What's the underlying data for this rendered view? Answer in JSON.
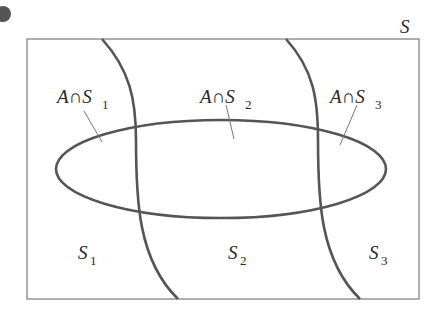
{
  "diagram": {
    "universe_label": "S",
    "set_label": "A",
    "intersection_symbol": "∩",
    "regions": [
      {
        "label": "A∩S1",
        "base": "S",
        "sub": "1",
        "prefix": "A∩"
      },
      {
        "label": "A∩S2",
        "base": "S",
        "sub": "2",
        "prefix": "A∩"
      },
      {
        "label": "A∩S3",
        "base": "S",
        "sub": "3",
        "prefix": "A∩"
      }
    ],
    "partitions": [
      {
        "label": "S1",
        "base": "S",
        "sub": "1"
      },
      {
        "label": "S2",
        "base": "S",
        "sub": "2"
      },
      {
        "label": "S3",
        "base": "S",
        "sub": "3"
      }
    ],
    "colors": {
      "stroke": "#555555",
      "thin_stroke": "#777777",
      "dot": "#555555"
    }
  }
}
